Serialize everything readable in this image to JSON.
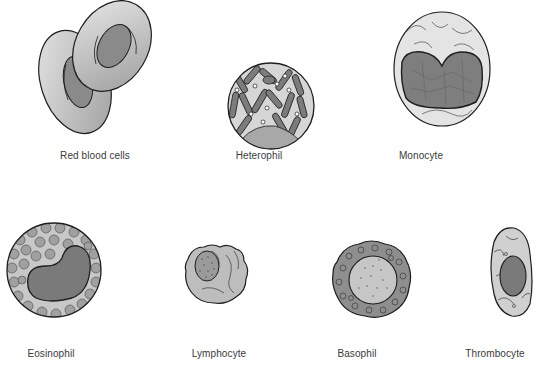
{
  "diagram": {
    "type": "illustration",
    "rows": [
      {
        "cells": [
          {
            "id": "rbc",
            "label": "Red blood cells",
            "label_x": 95,
            "label_y": 150
          },
          {
            "id": "heterophil",
            "label": "Heterophil",
            "label_x": 259,
            "label_y": 150
          },
          {
            "id": "monocyte",
            "label": "Monocyte",
            "label_x": 421,
            "label_y": 150
          }
        ]
      },
      {
        "cells": [
          {
            "id": "eosinophil",
            "label": "Eosinophil",
            "label_x": 51,
            "label_y": 348
          },
          {
            "id": "lymphocyte",
            "label": "Lymphocyte",
            "label_x": 219,
            "label_y": 348
          },
          {
            "id": "basophil",
            "label": "Basophil",
            "label_x": 357,
            "label_y": 348
          },
          {
            "id": "thrombocyte",
            "label": "Thrombocyte",
            "label_x": 495,
            "label_y": 348
          }
        ]
      }
    ],
    "colors": {
      "outline": "#1e1e1e",
      "cytoplasm_light": "#d8d8d8",
      "cytoplasm_mid": "#b5b5b5",
      "nucleus_dark": "#7a7a7a",
      "granule": "#9c9c9c",
      "background": "#ffffff"
    }
  }
}
